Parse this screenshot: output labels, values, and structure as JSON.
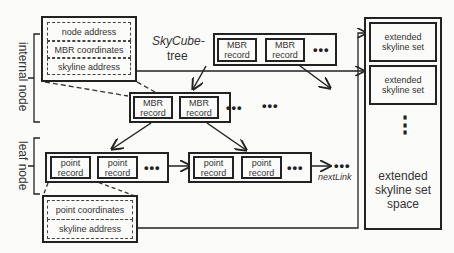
{
  "title": {
    "line1": "SkyCube-",
    "line2": "tree"
  },
  "side_labels": {
    "internal": "internal node",
    "leaf": "leaf node"
  },
  "internal_detail": {
    "fields": [
      "node address",
      "MBR coordinates",
      "skyline address"
    ]
  },
  "leaf_detail": {
    "fields": [
      "point coordinates",
      "skyline address"
    ]
  },
  "root_node": {
    "records": [
      "MBR record",
      "MBR record"
    ],
    "ellipsis": "•••"
  },
  "internal_node": {
    "records": [
      "MBR record",
      "MBR record"
    ],
    "ellipsis": "•••",
    "ellipsis2": "•••"
  },
  "leaf_node_1": {
    "records": [
      "point record",
      "point record"
    ],
    "ellipsis": "•••"
  },
  "leaf_node_2": {
    "records": [
      "point record",
      "point record"
    ],
    "ellipsis": "•••"
  },
  "next_link": {
    "ellipsis": "•••",
    "label": "nextLink"
  },
  "skyline_space": {
    "sets": [
      "extended skyline set",
      "extended skyline set"
    ],
    "vertical_ellipsis": "⋮",
    "label": "extended skyline set space"
  },
  "colors": {
    "line": "#222222",
    "background": "#fbfbf9",
    "text": "#333333"
  }
}
